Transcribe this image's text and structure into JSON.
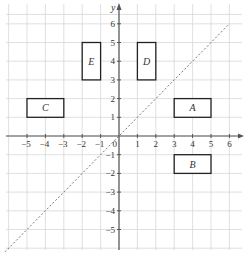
{
  "diagram": {
    "grid": {
      "xmin": -6,
      "xmax": 6.5,
      "ymin": -6,
      "ymax": 6.5
    },
    "axes": {
      "x_label": "",
      "y_label": "y",
      "origin_label": "0"
    },
    "x_ticks": [
      -5,
      -4,
      -3,
      -2,
      -1,
      1,
      2,
      3,
      4,
      5,
      6
    ],
    "y_ticks": [
      -5,
      -4,
      -3,
      -2,
      -1,
      1,
      2,
      3,
      4,
      5,
      6
    ],
    "line": {
      "equation": "y = x",
      "style": "dotted",
      "from": [
        -6.2,
        -6.2
      ],
      "to": [
        6,
        6
      ]
    },
    "shapes": [
      {
        "label": "A",
        "x1": 3,
        "y1": 1,
        "x2": 5,
        "y2": 2
      },
      {
        "label": "B",
        "x1": 3,
        "y1": -2,
        "x2": 5,
        "y2": -1
      },
      {
        "label": "C",
        "x1": -5,
        "y1": 1,
        "x2": -3,
        "y2": 2
      },
      {
        "label": "D",
        "x1": 1,
        "y1": 3,
        "x2": 2,
        "y2": 5
      },
      {
        "label": "E",
        "x1": -2,
        "y1": 3,
        "x2": -1,
        "y2": 5
      }
    ],
    "colors": {
      "grid": "#d8d8d8",
      "axis": "#555555",
      "shape": "#222222",
      "line": "#777777"
    }
  }
}
